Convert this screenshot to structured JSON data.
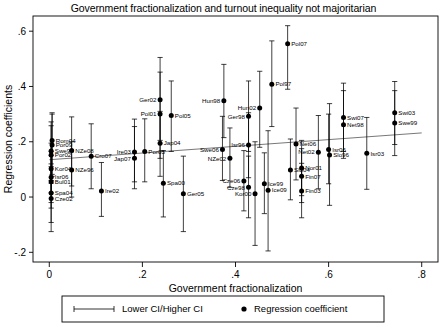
{
  "chart_data": {
    "type": "scatter",
    "title": "Government fractionalization and turnout inequality not majoritarian",
    "xlabel": "Government fractionalization",
    "ylabel": "Regression coefficients",
    "xlim": [
      -0.035,
      0.835
    ],
    "ylim": [
      -0.235,
      0.655
    ],
    "xticks": [
      "0",
      ".2",
      ".4",
      ".6",
      ".8"
    ],
    "xtick_values": [
      0,
      0.2,
      0.4,
      0.6,
      0.8
    ],
    "yticks": [
      "-.2",
      "0",
      ".2",
      ".4",
      ".6"
    ],
    "ytick_values": [
      -0.2,
      0,
      0.2,
      0.4,
      0.6
    ],
    "grid": false,
    "legend_position": "below-axis",
    "legend": [
      {
        "marker": "errorbar",
        "label": "Lower CI/Higher CI"
      },
      {
        "marker": "dot",
        "label": "Regression coefficient"
      }
    ],
    "trendline": {
      "x0": 0.0,
      "y0": 0.135,
      "x1": 0.8,
      "y1": 0.232
    },
    "points": [
      {
        "label": "Rom04",
        "x": 0.006,
        "y": 0.205,
        "lo": 0.075,
        "hi": 0.305,
        "lpos": "r"
      },
      {
        "label": "Por09",
        "x": 0.006,
        "y": 0.188,
        "lo": 0.082,
        "hi": 0.3,
        "lpos": "r"
      },
      {
        "label": "Swe98",
        "x": 0.004,
        "y": 0.167,
        "lo": 0.06,
        "hi": 0.272,
        "lpos": "r"
      },
      {
        "label": "Por02",
        "x": 0.004,
        "y": 0.152,
        "lo": 0.05,
        "hi": 0.258,
        "lpos": "r"
      },
      {
        "label": "Kor04",
        "x": 0.004,
        "y": 0.102,
        "lo": 0.015,
        "hi": 0.195,
        "lpos": "r"
      },
      {
        "label": "Isr06",
        "x": 0.004,
        "y": 0.072,
        "lo": -0.02,
        "hi": 0.165,
        "lpos": "r"
      },
      {
        "label": "Bul01",
        "x": 0.004,
        "y": 0.055,
        "lo": -0.04,
        "hi": 0.15,
        "lpos": "r"
      },
      {
        "label": "Spa04",
        "x": 0.004,
        "y": 0.015,
        "lo": -0.092,
        "hi": 0.12,
        "lpos": "r"
      },
      {
        "label": "Cze02",
        "x": 0.004,
        "y": -0.005,
        "lo": -0.125,
        "hi": 0.11,
        "lpos": "r"
      },
      {
        "label": "NZe08",
        "x": 0.048,
        "y": 0.168,
        "lo": 0.04,
        "hi": 0.29,
        "lpos": "r"
      },
      {
        "label": "NZe96",
        "x": 0.048,
        "y": 0.098,
        "lo": 0.0,
        "hi": 0.2,
        "lpos": "r"
      },
      {
        "label": "Cro07",
        "x": 0.09,
        "y": 0.148,
        "lo": 0.03,
        "hi": 0.265,
        "lpos": "r"
      },
      {
        "label": "Ire02",
        "x": 0.112,
        "y": 0.022,
        "lo": -0.07,
        "hi": 0.125,
        "lpos": "r"
      },
      {
        "label": "Ire03",
        "x": 0.183,
        "y": 0.163,
        "lo": 0.055,
        "hi": 0.282,
        "lpos": "l"
      },
      {
        "label": "Jap07",
        "x": 0.183,
        "y": 0.14,
        "lo": 0.03,
        "hi": 0.255,
        "lpos": "l"
      },
      {
        "label": "Por05",
        "x": 0.205,
        "y": 0.165,
        "lo": 0.055,
        "hi": 0.283,
        "lpos": "r"
      },
      {
        "label": "Ger02",
        "x": 0.238,
        "y": 0.352,
        "lo": 0.205,
        "hi": 0.505,
        "lpos": "l"
      },
      {
        "label": "Pol01",
        "x": 0.238,
        "y": 0.3,
        "lo": 0.14,
        "hi": 0.452,
        "lpos": "l"
      },
      {
        "label": "Jap04",
        "x": 0.238,
        "y": 0.195,
        "lo": 0.075,
        "hi": 0.31,
        "lpos": "r"
      },
      {
        "label": "Pol05",
        "x": 0.262,
        "y": 0.295,
        "lo": 0.165,
        "hi": 0.42,
        "lpos": "r"
      },
      {
        "label": "Spa00",
        "x": 0.245,
        "y": 0.05,
        "lo": -0.072,
        "hi": 0.168,
        "lpos": "r"
      },
      {
        "label": "Ger05",
        "x": 0.288,
        "y": 0.012,
        "lo": -0.125,
        "hi": 0.148,
        "lpos": "r"
      },
      {
        "label": "Swe06",
        "x": 0.372,
        "y": 0.172,
        "lo": 0.06,
        "hi": 0.292,
        "lpos": "l"
      },
      {
        "label": "NZe02",
        "x": 0.388,
        "y": 0.14,
        "lo": 0.035,
        "hi": 0.25,
        "lpos": "l"
      },
      {
        "label": "Hun98",
        "x": 0.375,
        "y": 0.348,
        "lo": 0.215,
        "hi": 0.48,
        "lpos": "l"
      },
      {
        "label": "Ger98",
        "x": 0.428,
        "y": 0.292,
        "lo": 0.165,
        "hi": 0.42,
        "lpos": "l"
      },
      {
        "label": "Isr96",
        "x": 0.428,
        "y": 0.188,
        "lo": 0.07,
        "hi": 0.305,
        "lpos": "l"
      },
      {
        "label": "Cze06",
        "x": 0.418,
        "y": 0.058,
        "lo": -0.05,
        "hi": 0.168,
        "lpos": "l"
      },
      {
        "label": "Cze98",
        "x": 0.428,
        "y": 0.035,
        "lo": -0.075,
        "hi": 0.148,
        "lpos": "l"
      },
      {
        "label": "Kor00",
        "x": 0.442,
        "y": 0.012,
        "lo": -0.175,
        "hi": 0.2,
        "lpos": "l"
      },
      {
        "label": "Hun02",
        "x": 0.452,
        "y": 0.322,
        "lo": 0.18,
        "hi": 0.455,
        "lpos": "l"
      },
      {
        "label": "Ice99",
        "x": 0.462,
        "y": 0.048,
        "lo": -0.06,
        "hi": 0.16,
        "lpos": "r"
      },
      {
        "label": "Ice09",
        "x": 0.47,
        "y": 0.025,
        "lo": -0.195,
        "hi": 0.24,
        "lpos": "r"
      },
      {
        "label": "Pol97",
        "x": 0.478,
        "y": 0.408,
        "lo": 0.255,
        "hi": 0.565,
        "lpos": "r"
      },
      {
        "label": "Pol07",
        "x": 0.512,
        "y": 0.555,
        "lo": 0.39,
        "hi": 0.62,
        "lpos": "r"
      },
      {
        "label": "Slo04",
        "x": 0.518,
        "y": 0.098,
        "lo": -0.01,
        "hi": 0.21,
        "lpos": "r"
      },
      {
        "label": "Net06",
        "x": 0.53,
        "y": 0.192,
        "lo": 0.062,
        "hi": 0.322,
        "lpos": "r"
      },
      {
        "label": "Nor01",
        "x": 0.542,
        "y": 0.105,
        "lo": 0.005,
        "hi": 0.205,
        "lpos": "r"
      },
      {
        "label": "Fin07",
        "x": 0.542,
        "y": 0.075,
        "lo": -0.02,
        "hi": 0.175,
        "lpos": "r"
      },
      {
        "label": "Fin03",
        "x": 0.542,
        "y": 0.022,
        "lo": -0.075,
        "hi": 0.122,
        "lpos": "r"
      },
      {
        "label": "Net02",
        "x": 0.578,
        "y": 0.162,
        "lo": 0.03,
        "hi": 0.295,
        "lpos": "l"
      },
      {
        "label": "Isr06b",
        "x": 0.6,
        "y": 0.172,
        "lo": 0.048,
        "hi": 0.3,
        "lpos": "r"
      },
      {
        "label": "Slo96",
        "x": 0.602,
        "y": 0.152,
        "lo": -0.03,
        "hi": 0.338,
        "lpos": "r"
      },
      {
        "label": "Swi07",
        "x": 0.632,
        "y": 0.288,
        "lo": 0.165,
        "hi": 0.412,
        "lpos": "r"
      },
      {
        "label": "Net98",
        "x": 0.632,
        "y": 0.262,
        "lo": 0.14,
        "hi": 0.385,
        "lpos": "r"
      },
      {
        "label": "Isr03",
        "x": 0.682,
        "y": 0.158,
        "lo": 0.028,
        "hi": 0.288,
        "lpos": "r"
      },
      {
        "label": "Swi03",
        "x": 0.742,
        "y": 0.305,
        "lo": 0.19,
        "hi": 0.418,
        "lpos": "r"
      },
      {
        "label": "Swe99",
        "x": 0.742,
        "y": 0.268,
        "lo": 0.15,
        "hi": 0.385,
        "lpos": "r"
      }
    ]
  }
}
